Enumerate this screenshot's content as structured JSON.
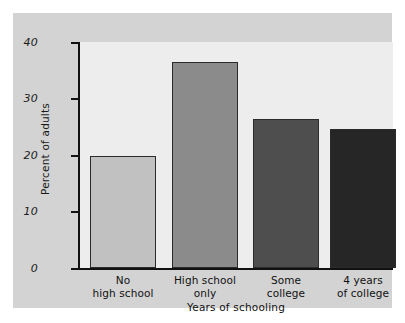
{
  "chart_data": {
    "type": "bar",
    "title": "",
    "xlabel": "Years of schooling",
    "ylabel": "Percent of adults",
    "categories": [
      "No high school",
      "High school only",
      "Some college",
      "4 years of college"
    ],
    "category_lines": [
      [
        "No",
        "high school"
      ],
      [
        "High school",
        "only"
      ],
      [
        "Some",
        "college"
      ],
      [
        "4 years",
        "of college"
      ]
    ],
    "values": [
      19.8,
      36.5,
      26.3,
      24.6
    ],
    "ylim": [
      0,
      40
    ],
    "yticks": [
      0,
      10,
      20,
      30,
      40
    ],
    "ytick_labels": [
      "0",
      "10",
      "20",
      "30",
      "40"
    ],
    "grid": false,
    "legend": "none",
    "bar_colors": [
      "#c1c1c1",
      "#8b8b8b",
      "#4e4e4e",
      "#262626"
    ],
    "bar_edge_color": "#2b2b2b",
    "panel_color": "#d3d3d3",
    "plot_background": "#ededed",
    "axis_color": "#111111"
  }
}
